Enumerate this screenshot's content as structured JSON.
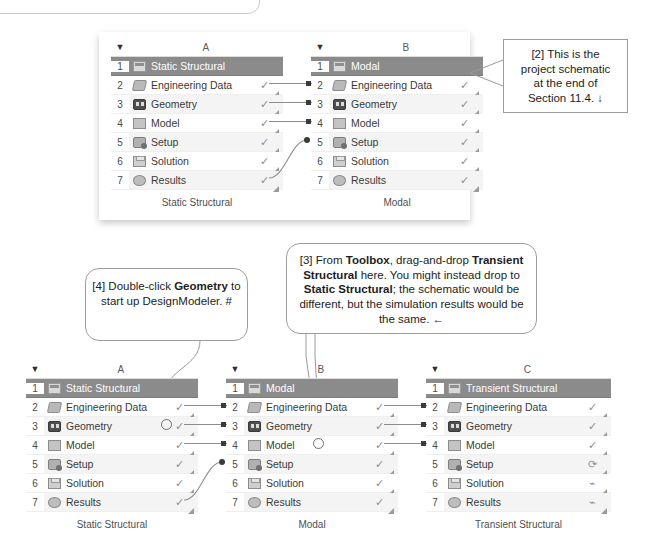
{
  "colors": {
    "title_row_bg": "#8b8b8b",
    "title_row_text": "#ffffff",
    "alt_row_bg": "#f4f4f4",
    "connector": "#3b3b3b",
    "callout_border": "#9d9d9d"
  },
  "icons": {
    "caret": "▼",
    "check": "✓",
    "refresh": "⟳",
    "bolt": "⌁",
    "grip": "resize-grip-icon"
  },
  "schematic_top": {
    "systems": [
      {
        "column": "A",
        "caret": "▼",
        "footer": "Static Structural",
        "rows": [
          {
            "num": "1",
            "label": "Static Structural",
            "icon": "analysis-icon",
            "state": ""
          },
          {
            "num": "2",
            "label": "Engineering Data",
            "icon": "engineering-data-icon",
            "state": "✓"
          },
          {
            "num": "3",
            "label": "Geometry",
            "icon": "geometry-icon",
            "state": "✓"
          },
          {
            "num": "4",
            "label": "Model",
            "icon": "model-icon",
            "state": "✓"
          },
          {
            "num": "5",
            "label": "Setup",
            "icon": "setup-icon",
            "state": "✓"
          },
          {
            "num": "6",
            "label": "Solution",
            "icon": "solution-icon",
            "state": "✓"
          },
          {
            "num": "7",
            "label": "Results",
            "icon": "results-icon",
            "state": "✓"
          }
        ]
      },
      {
        "column": "B",
        "caret": "▼",
        "footer": "Modal",
        "rows": [
          {
            "num": "1",
            "label": "Modal",
            "icon": "analysis-icon",
            "state": ""
          },
          {
            "num": "2",
            "label": "Engineering Data",
            "icon": "engineering-data-icon",
            "state": "✓"
          },
          {
            "num": "3",
            "label": "Geometry",
            "icon": "geometry-icon",
            "state": "✓"
          },
          {
            "num": "4",
            "label": "Model",
            "icon": "model-icon",
            "state": "✓"
          },
          {
            "num": "5",
            "label": "Setup",
            "icon": "setup-icon",
            "state": "✓"
          },
          {
            "num": "6",
            "label": "Solution",
            "icon": "solution-icon",
            "state": "✓"
          },
          {
            "num": "7",
            "label": "Results",
            "icon": "results-icon",
            "state": "✓"
          }
        ]
      }
    ]
  },
  "schematic_bottom": {
    "systems": [
      {
        "column": "A",
        "caret": "▼",
        "footer": "Static Structural",
        "rows": [
          {
            "num": "1",
            "label": "Static Structural",
            "icon": "analysis-icon",
            "state": ""
          },
          {
            "num": "2",
            "label": "Engineering Data",
            "icon": "engineering-data-icon",
            "state": "✓"
          },
          {
            "num": "3",
            "label": "Geometry",
            "icon": "geometry-icon",
            "state": "✓"
          },
          {
            "num": "4",
            "label": "Model",
            "icon": "model-icon",
            "state": "✓"
          },
          {
            "num": "5",
            "label": "Setup",
            "icon": "setup-icon",
            "state": "✓"
          },
          {
            "num": "6",
            "label": "Solution",
            "icon": "solution-icon",
            "state": "✓"
          },
          {
            "num": "7",
            "label": "Results",
            "icon": "results-icon",
            "state": "✓"
          }
        ]
      },
      {
        "column": "B",
        "caret": "▼",
        "footer": "Modal",
        "rows": [
          {
            "num": "1",
            "label": "Modal",
            "icon": "analysis-icon",
            "state": ""
          },
          {
            "num": "2",
            "label": "Engineering Data",
            "icon": "engineering-data-icon",
            "state": "✓"
          },
          {
            "num": "3",
            "label": "Geometry",
            "icon": "geometry-icon",
            "state": "✓"
          },
          {
            "num": "4",
            "label": "Model",
            "icon": "model-icon",
            "state": "✓"
          },
          {
            "num": "5",
            "label": "Setup",
            "icon": "setup-icon",
            "state": "✓"
          },
          {
            "num": "6",
            "label": "Solution",
            "icon": "solution-icon",
            "state": "✓"
          },
          {
            "num": "7",
            "label": "Results",
            "icon": "results-icon",
            "state": "✓"
          }
        ]
      },
      {
        "column": "C",
        "caret": "▼",
        "footer": "Transient Structural",
        "rows": [
          {
            "num": "1",
            "label": "Transient Structural",
            "icon": "analysis-icon",
            "state": ""
          },
          {
            "num": "2",
            "label": "Engineering Data",
            "icon": "engineering-data-icon",
            "state": "✓"
          },
          {
            "num": "3",
            "label": "Geometry",
            "icon": "geometry-icon",
            "state": "✓"
          },
          {
            "num": "4",
            "label": "Model",
            "icon": "model-icon",
            "state": "✓"
          },
          {
            "num": "5",
            "label": "Setup",
            "icon": "setup-icon",
            "state": "⟳"
          },
          {
            "num": "6",
            "label": "Solution",
            "icon": "solution-icon",
            "state": "⌁"
          },
          {
            "num": "7",
            "label": "Results",
            "icon": "results-icon",
            "state": "⌁"
          }
        ]
      }
    ]
  },
  "callouts": {
    "two": {
      "id": "[2]",
      "line1": "[2] This is the",
      "line2": "project schematic",
      "line3": "at the end of",
      "line4": "Section 11.4. ↓",
      "full_text": "[2] This is the project schematic at the end of Section 11.4. ↓"
    },
    "three": {
      "id": "[3]",
      "seg1": "[3] From ",
      "bold1": "Toolbox",
      "seg2": ", drag-and-drop ",
      "bold2": "Transient Structural",
      "seg3": " here. You might instead drop to ",
      "bold3": "Static Structural",
      "seg4": "; the schematic would be different, but the simulation results would be the same. ←",
      "full_text": "[3] From Toolbox, drag-and-drop Transient Structural here. You might instead drop to Static Structural; the schematic would be different, but the simulation results would be the same. ←"
    },
    "four": {
      "id": "[4]",
      "seg1": "[4] Double-click ",
      "bold1": "Geometry",
      "seg2": " to start up DesignModeler. #",
      "full_text": "[4] Double-click Geometry to start up DesignModeler. #"
    }
  }
}
